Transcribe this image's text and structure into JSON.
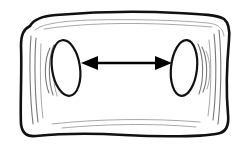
{
  "figure": {
    "background_color": "#ffffff",
    "ink_color": "#111111",
    "shading_color": "#777777",
    "arrow_color": "#000000",
    "width": 243,
    "height": 153,
    "style": "hand-drawn line art, black ink on white, no text labels"
  },
  "elements": {
    "body_outline": {
      "name": "rounded rectangular slab",
      "description": "closed freehand contour with rounded corners, concave top and bottom edges and slightly convex left and right sides",
      "corners": {
        "top_left": [
          27,
          18
        ],
        "top_right": [
          228,
          15
        ],
        "bottom_right": [
          222,
          130
        ],
        "bottom_left": [
          22,
          133
        ]
      },
      "path": "M 30,26 C 34,19 42,16 56,15 C 92,12 140,11 178,13 C 202,14 218,15 224,19 C 229,23 230,30 229,40 C 227,62 226,92 228,114 C 229,124 227,131 220,133 C 206,137 160,137 124,135 C 92,133 56,134 36,136 C 27,137 22,133 21,124 C 20,106 22,72 21,46 C 21,34 24,29 30,26 Z",
      "inner_path": "M 35,30 C 42,24 60,21 92,20 C 132,19 176,20 208,23 C 218,24 223,28 224,36"
    },
    "body_edge_shading": {
      "name": "thickness lines along inside of border",
      "left": [
        "M 31,36 C 29,60 30,98 33,124",
        "M 36,38 C 34,62 35,98 38,122",
        "M 41,44 C 40,64 40,96 43,118"
      ],
      "right": [
        "M 219,30 C 222,58 221,98 218,124",
        "M 214,34 C 217,60 216,96 213,120",
        "M 209,40 C 212,64 211,94 208,116"
      ],
      "bottom": [
        "M 52,124 C 96,119 150,118 200,122",
        "M 62,128 C 104,124 152,123 196,127"
      ],
      "top": [
        "M 44,29 C 90,22 150,22 212,27"
      ]
    },
    "hole_left": {
      "name": "left elliptical hole",
      "center": [
        66,
        68
      ],
      "rx": 14,
      "ry": 28,
      "rotation_deg": -8,
      "shading_arcs": [
        "M 50,48 C 44,60 44,80 49,93",
        "M 54,45 C 48,58 48,80 53,95",
        "M 58,43 C 52,57 52,80 57,96"
      ]
    },
    "hole_right": {
      "name": "right elliptical hole",
      "center": [
        184,
        68
      ],
      "rx": 13,
      "ry": 28,
      "rotation_deg": 6,
      "shading_arcs": [
        "M 198,44 C 204,57 204,80 199,94",
        "M 202,47 C 208,59 208,80 203,92",
        "M 206,51 C 211,61 211,78 207,89"
      ]
    },
    "dimension_arrow": {
      "name": "double-headed horizontal arrow between the two holes",
      "orientation": "horizontal",
      "y": 63,
      "left_tip_x": 81,
      "right_tip_x": 172,
      "length_px": 91,
      "head_length": 17,
      "head_half_width": 7,
      "heads": "both",
      "label": ""
    }
  }
}
